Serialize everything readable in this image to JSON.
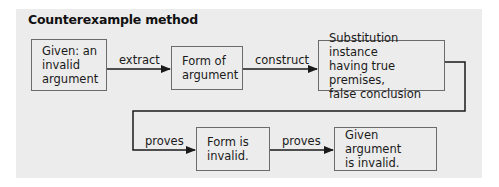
{
  "diagram": {
    "title": "Counterexample method",
    "nodes": [
      {
        "id": "given",
        "label": "Given: an\ninvalid\nargument"
      },
      {
        "id": "form",
        "label": "Form of\nargument"
      },
      {
        "id": "substitution",
        "label": "Substitution instance\nhaving true premises,\nfalse conclusion"
      },
      {
        "id": "form-invalid",
        "label": "Form is\ninvalid."
      },
      {
        "id": "given-invalid",
        "label": "Given argument\nis invalid."
      }
    ],
    "edges": [
      {
        "from": "given",
        "to": "form",
        "label": "extract"
      },
      {
        "from": "form",
        "to": "substitution",
        "label": "construct"
      },
      {
        "from": "substitution",
        "to": "form-invalid",
        "label": "proves"
      },
      {
        "from": "form-invalid",
        "to": "given-invalid",
        "label": "proves"
      }
    ],
    "colors": {
      "panel_bg": "#ececec",
      "box_border": "#6b6b6b",
      "line": "#1a1a1a"
    }
  }
}
